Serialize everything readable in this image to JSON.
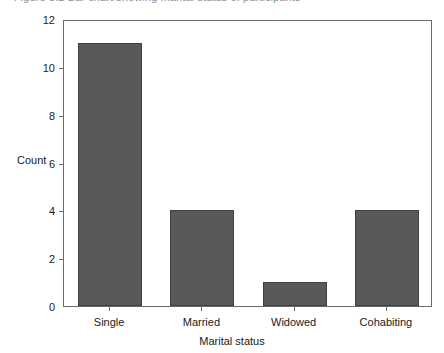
{
  "figure": {
    "caption_clipped": "Figure 3.2  Bar chart showing marital status of participants"
  },
  "chart_data": {
    "type": "bar",
    "title": "",
    "categories": [
      "Single",
      "Married",
      "Widowed",
      "Cohabiting"
    ],
    "values": [
      11,
      4,
      1,
      4
    ],
    "series": [
      {
        "name": "Count",
        "values": [
          11,
          4,
          1,
          4
        ]
      }
    ],
    "xlabel": "Marital status",
    "ylabel": "Count",
    "ylim": [
      0,
      12
    ],
    "yticks": [
      0,
      2,
      4,
      6,
      8,
      10,
      12
    ],
    "ytick_labels": [
      "0",
      "2",
      "4",
      "6",
      "8",
      "10",
      "12"
    ],
    "grid": false,
    "legend": false,
    "legend_position": "none",
    "bar_color": "#595959",
    "bar_edge_color": "#3f3f3f",
    "frame_color": "#6b6b6b",
    "background": "#ffffff"
  }
}
